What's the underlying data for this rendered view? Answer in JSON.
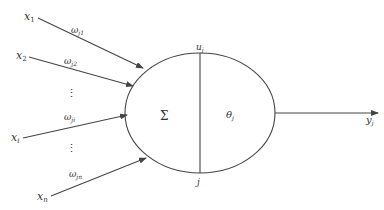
{
  "diagram": {
    "type": "artificial-neuron",
    "inputs": [
      {
        "name": "x",
        "sub": "1",
        "weight": "ω",
        "weight_sub": "j1"
      },
      {
        "name": "x",
        "sub": "2",
        "weight": "ω",
        "weight_sub": "j2"
      },
      {
        "name": "x",
        "sub": "i",
        "weight": "ω",
        "weight_sub": "ji"
      },
      {
        "name": "x",
        "sub": "n",
        "weight": "ω",
        "weight_sub": "jn"
      }
    ],
    "ellipsis": "⋮",
    "neuron": {
      "sum_symbol": "Σ",
      "threshold": "θ",
      "threshold_sub": "j",
      "top_label": "u",
      "top_label_sub": "j",
      "bottom_label": "j"
    },
    "output": {
      "name": "y",
      "sub": "j"
    },
    "colors": {
      "stroke": "#444444",
      "text": "#333333",
      "background": "#ffffff"
    }
  }
}
